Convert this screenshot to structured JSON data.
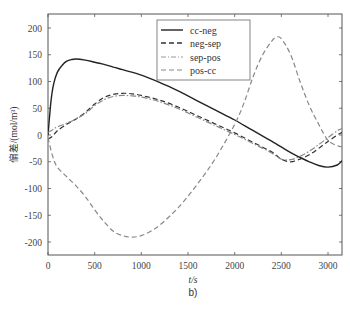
{
  "chart_data": {
    "type": "line",
    "title": "",
    "subtitle": "b)",
    "xlabel": "t/s",
    "ylabel": "偏差/(mol/m³)",
    "xlim": [
      0,
      3150
    ],
    "ylim": [
      -225,
      225
    ],
    "xticks": [
      0,
      500,
      1000,
      1500,
      2000,
      2500,
      3000
    ],
    "yticks": [
      -200,
      -150,
      -100,
      -50,
      0,
      50,
      100,
      150,
      200
    ],
    "grid": false,
    "legend_position": "upper center",
    "series": [
      {
        "name": "cc-neg",
        "style": "solid",
        "color": "#222222",
        "x": [
          0,
          30,
          60,
          100,
          150,
          200,
          250,
          300,
          400,
          500,
          600,
          700,
          800,
          1000,
          1200,
          1400,
          1600,
          1800,
          2000,
          2200,
          2400,
          2600,
          2700,
          2800,
          2900,
          3000,
          3100,
          3150
        ],
        "y": [
          0,
          60,
          95,
          117,
          130,
          138,
          141,
          142,
          140,
          136,
          132,
          127,
          122,
          112,
          98,
          82,
          64,
          46,
          28,
          8,
          -12,
          -33,
          -42,
          -50,
          -57,
          -60,
          -56,
          -48
        ]
      },
      {
        "name": "neg-sep",
        "style": "dashed",
        "color": "#333333",
        "x": [
          0,
          50,
          100,
          200,
          300,
          400,
          500,
          600,
          700,
          800,
          900,
          1000,
          1200,
          1400,
          1600,
          1800,
          2000,
          2200,
          2400,
          2500,
          2600,
          2700,
          2800,
          2900,
          3000,
          3100,
          3150
        ],
        "y": [
          -8,
          -2,
          8,
          20,
          30,
          42,
          58,
          70,
          76,
          78,
          77,
          74,
          65,
          52,
          36,
          20,
          4,
          -14,
          -32,
          -45,
          -50,
          -45,
          -37,
          -25,
          -12,
          0,
          5
        ]
      },
      {
        "name": "sep-pos",
        "style": "dash-dot",
        "color": "#888888",
        "x": [
          0,
          50,
          100,
          200,
          300,
          400,
          500,
          600,
          700,
          800,
          900,
          1000,
          1200,
          1400,
          1600,
          1800,
          2000,
          2200,
          2400,
          2500,
          2600,
          2700,
          2800,
          2900,
          3000,
          3100,
          3150
        ],
        "y": [
          5,
          10,
          15,
          22,
          30,
          40,
          55,
          66,
          72,
          74,
          73,
          71,
          62,
          49,
          33,
          17,
          1,
          -16,
          -34,
          -45,
          -46,
          -40,
          -30,
          -18,
          -5,
          8,
          12
        ]
      },
      {
        "name": "pos-cc",
        "style": "dashed",
        "color": "#888888",
        "x": [
          0,
          50,
          100,
          200,
          300,
          400,
          500,
          600,
          700,
          800,
          900,
          1000,
          1100,
          1200,
          1400,
          1600,
          1800,
          2000,
          2100,
          2200,
          2300,
          2400,
          2450,
          2500,
          2600,
          2700,
          2800,
          2900,
          3000,
          3100,
          3150
        ],
        "y": [
          -5,
          -40,
          -60,
          -78,
          -95,
          -115,
          -140,
          -162,
          -180,
          -188,
          -191,
          -188,
          -180,
          -168,
          -135,
          -92,
          -42,
          20,
          60,
          110,
          150,
          176,
          183,
          180,
          150,
          100,
          55,
          20,
          -10,
          -20,
          -22
        ]
      }
    ]
  },
  "legend": {
    "items": [
      {
        "label": "cc-neg"
      },
      {
        "label": "neg-sep"
      },
      {
        "label": "sep-pos"
      },
      {
        "label": "pos-cc"
      }
    ]
  }
}
